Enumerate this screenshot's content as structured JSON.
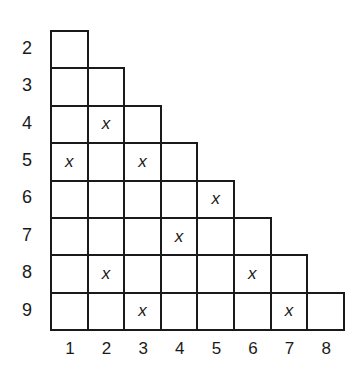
{
  "diagram": {
    "type": "triangular-grid",
    "row_labels": [
      "2",
      "3",
      "4",
      "5",
      "6",
      "7",
      "8",
      "9"
    ],
    "col_labels": [
      "1",
      "2",
      "3",
      "4",
      "5",
      "6",
      "7",
      "8"
    ],
    "mark_symbol": "x",
    "marks": [
      {
        "row": "4",
        "col": "2"
      },
      {
        "row": "5",
        "col": "1"
      },
      {
        "row": "5",
        "col": "3"
      },
      {
        "row": "6",
        "col": "5"
      },
      {
        "row": "7",
        "col": "4"
      },
      {
        "row": "8",
        "col": "2"
      },
      {
        "row": "8",
        "col": "6"
      },
      {
        "row": "9",
        "col": "3"
      },
      {
        "row": "9",
        "col": "7"
      }
    ],
    "colors": {
      "line": "#1a1a1a",
      "background": "#ffffff"
    }
  }
}
